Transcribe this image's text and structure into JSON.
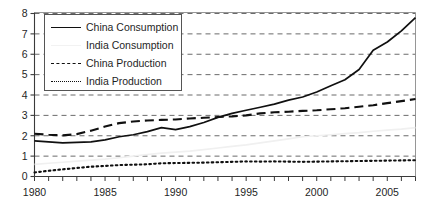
{
  "chart_data": {
    "type": "line",
    "title": "",
    "subtitle": "",
    "xlabel": "",
    "ylabel": "",
    "xlim": [
      1980,
      2007
    ],
    "ylim": [
      0,
      8
    ],
    "y_ticks": [
      "0",
      "1",
      "2",
      "3",
      "4",
      "5",
      "6",
      "7",
      "8"
    ],
    "x_ticks_major": [
      "1980",
      "1985",
      "1990",
      "1995",
      "2000",
      "2005"
    ],
    "x_minor_tick_interval": 1,
    "grid": "horizontal-dashed",
    "legend_position": "top-left-inside",
    "x": [
      1980,
      1981,
      1982,
      1983,
      1984,
      1985,
      1986,
      1987,
      1988,
      1989,
      1990,
      1991,
      1992,
      1993,
      1994,
      1995,
      1996,
      1997,
      1998,
      1999,
      2000,
      2001,
      2002,
      2003,
      2004,
      2005,
      2006,
      2007
    ],
    "series": [
      {
        "name": "China Consumption",
        "style": "solid",
        "color": "#101010",
        "values": [
          1.75,
          1.7,
          1.65,
          1.67,
          1.7,
          1.8,
          1.95,
          2.05,
          2.2,
          2.4,
          2.3,
          2.45,
          2.65,
          2.9,
          3.1,
          3.25,
          3.4,
          3.55,
          3.75,
          3.9,
          4.15,
          4.45,
          4.75,
          5.25,
          6.2,
          6.6,
          7.15,
          7.8
        ]
      },
      {
        "name": "India Consumption",
        "style": "solid",
        "color": "#f0f0f0",
        "values": [
          0.6,
          0.65,
          0.7,
          0.75,
          0.8,
          0.85,
          0.92,
          1.0,
          1.08,
          1.15,
          1.2,
          1.25,
          1.32,
          1.4,
          1.48,
          1.55,
          1.65,
          1.75,
          1.85,
          1.95,
          2.0,
          2.05,
          2.1,
          2.15,
          2.22,
          2.28,
          2.33,
          2.4
        ]
      },
      {
        "name": "China Production",
        "style": "dashed",
        "color": "#101010",
        "values": [
          2.1,
          2.05,
          2.02,
          2.08,
          2.25,
          2.45,
          2.62,
          2.7,
          2.75,
          2.78,
          2.8,
          2.85,
          2.88,
          2.92,
          2.95,
          3.0,
          3.1,
          3.15,
          3.18,
          3.22,
          3.25,
          3.3,
          3.35,
          3.42,
          3.5,
          3.6,
          3.7,
          3.8
        ]
      },
      {
        "name": "India Production",
        "style": "dotted",
        "color": "#101010",
        "values": [
          0.2,
          0.28,
          0.35,
          0.42,
          0.48,
          0.52,
          0.56,
          0.58,
          0.6,
          0.65,
          0.66,
          0.67,
          0.68,
          0.7,
          0.72,
          0.74,
          0.73,
          0.74,
          0.73,
          0.72,
          0.73,
          0.74,
          0.75,
          0.76,
          0.77,
          0.78,
          0.79,
          0.8
        ]
      }
    ]
  },
  "legend": {
    "items": [
      {
        "label": "China Consumption",
        "style": "solid"
      },
      {
        "label": "India Consumption",
        "style": "faint"
      },
      {
        "label": "China Production",
        "style": "dash"
      },
      {
        "label": "India Production",
        "style": "dot"
      }
    ]
  }
}
